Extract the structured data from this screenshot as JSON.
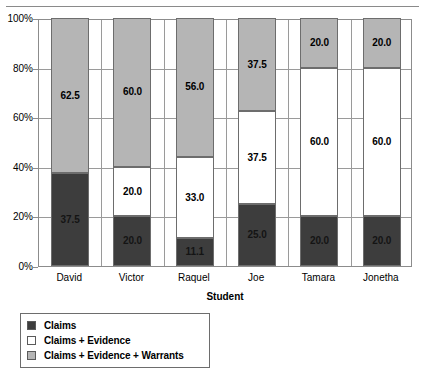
{
  "chart_data": {
    "type": "bar",
    "subtype": "stacked-percentage",
    "title": "",
    "xlabel": "Student",
    "ylabel": "",
    "ylim": [
      0,
      100
    ],
    "grid": true,
    "legend_position": "bottom-left",
    "categories": [
      "David",
      "Victor",
      "Raquel",
      "Joe",
      "Tamara",
      "Jonetha"
    ],
    "ytick_labels": [
      "0%",
      "20%",
      "40%",
      "60%",
      "80%",
      "100%"
    ],
    "ytick_values": [
      0,
      20,
      40,
      60,
      80,
      100
    ],
    "series": [
      {
        "name": "Claims",
        "color": "#3d3d3d",
        "values": [
          37.5,
          20.0,
          11.1,
          25.0,
          20.0,
          20.0
        ],
        "labels": [
          "37.5",
          "20.0",
          "11.1",
          "25.0",
          "20.0",
          "20.0"
        ]
      },
      {
        "name": "Claims + Evidence",
        "color": "#ffffff",
        "values": [
          0.0,
          20.0,
          33.0,
          37.5,
          60.0,
          60.0
        ],
        "labels": [
          "",
          "20.0",
          "33.0",
          "37.5",
          "60.0",
          "60.0"
        ]
      },
      {
        "name": "Claims + Evidence + Warrants",
        "color": "#b5b5b5",
        "values": [
          62.5,
          60.0,
          56.0,
          37.5,
          20.0,
          20.0
        ],
        "labels": [
          "62.5",
          "60.0",
          "56.0",
          "37.5",
          "20.0",
          "20.0"
        ]
      }
    ]
  },
  "axis": {
    "x_title": "Student",
    "y_ticks": [
      {
        "label": "100%",
        "value": 100
      },
      {
        "label": "80%",
        "value": 80
      },
      {
        "label": "60%",
        "value": 60
      },
      {
        "label": "40%",
        "value": 40
      },
      {
        "label": "20%",
        "value": 20
      },
      {
        "label": "0%",
        "value": 0
      }
    ],
    "x_ticks": [
      {
        "label": "David"
      },
      {
        "label": "Victor"
      },
      {
        "label": "Raquel"
      },
      {
        "label": "Joe"
      },
      {
        "label": "Tamara"
      },
      {
        "label": "Jonetha"
      }
    ]
  },
  "legend": {
    "items": [
      {
        "label": "Claims",
        "color": "#3d3d3d"
      },
      {
        "label": "Claims + Evidence",
        "color": "#ffffff"
      },
      {
        "label": "Claims + Evidence + Warrants",
        "color": "#b5b5b5"
      }
    ]
  }
}
